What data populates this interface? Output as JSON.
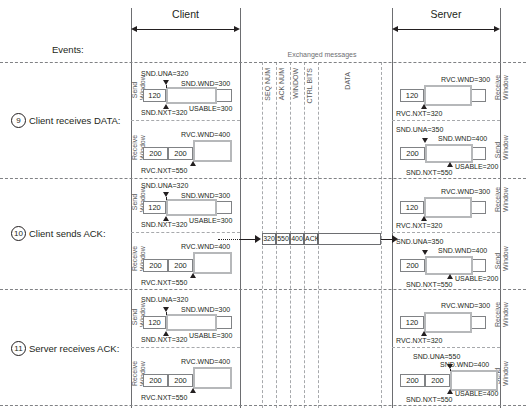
{
  "headers": {
    "client": "Client",
    "server": "Server",
    "events": "Events:",
    "exchanged": "Exchanged messages"
  },
  "message_fields": [
    "SEQ NUM",
    "ACK NUM",
    "WINDOW",
    "CTRL BITS",
    "DATA"
  ],
  "side_labels": {
    "send": "Send\nWindow",
    "receive": "Receive\nWindow"
  },
  "side_label_send_l1": "Send",
  "side_label_send_l2": "Window",
  "side_label_recv_l1": "Receive",
  "side_label_recv_l2": "Window",
  "rows": [
    {
      "num": "9",
      "event": "Client receives DATA:",
      "client": {
        "send": {
          "left_seg": "120",
          "una": "SND.UNA=320",
          "wnd": "SND.WND=300",
          "usable": "USABLE=300",
          "nxt": "SND.NXT=320"
        },
        "receive": {
          "seg1": "200",
          "seg2": "200",
          "wnd": "RVC.WND=400",
          "nxt": "RVC.NXT=550"
        }
      },
      "server": {
        "receive": {
          "left_seg": "120",
          "wnd": "RVC.WND=300",
          "nxt": "RVC.NXT=320"
        },
        "send": {
          "seg1": "200",
          "seg2": "200",
          "una": "SND.UNA=350",
          "wnd": "SND.WND=400",
          "usable": "USABLE=200",
          "nxt": "SND.NXT=550"
        }
      },
      "message": null
    },
    {
      "num": "10",
      "event": "Client sends ACK:",
      "client": {
        "send": {
          "left_seg": "120",
          "una": "SND.UNA=320",
          "wnd": "SND.WND=300",
          "usable": "USABLE=300",
          "nxt": "SND.NXT=320"
        },
        "receive": {
          "seg1": "200",
          "seg2": "200",
          "wnd": "RVC.WND=400",
          "nxt": "RVC.NXT=550"
        }
      },
      "server": {
        "receive": {
          "left_seg": "120",
          "wnd": "RVC.WND=300",
          "nxt": "RVC.NXT=320"
        },
        "send": {
          "seg1": "200",
          "seg2": "200",
          "una": "SND.UNA=350",
          "wnd": "SND.WND=400",
          "usable": "USABLE=200",
          "nxt": "SND.NXT=550"
        }
      },
      "message": {
        "seq_num": "320",
        "ack_num": "550",
        "window": "400",
        "ctrl_bits": "ACK",
        "data": "",
        "direction": "client-to-server"
      }
    },
    {
      "num": "11",
      "event": "Server receives ACK:",
      "client": {
        "send": {
          "left_seg": "120",
          "una": "SND.UNA=320",
          "wnd": "SND.WND=300",
          "usable": "USABLE=300",
          "nxt": "SND.NXT=320"
        },
        "receive": {
          "seg1": "200",
          "seg2": "200",
          "wnd": "RVC.WND=400",
          "nxt": "RVC.NXT=550"
        }
      },
      "server": {
        "receive": {
          "left_seg": "120",
          "wnd": "RVC.WND=300",
          "nxt": "RVC.NXT=320"
        },
        "send": {
          "seg1": "200",
          "seg2": "200",
          "una": "SND.UNA=550",
          "wnd": "SND.WND=400",
          "usable": "USABLE=400",
          "nxt": "SND.NXT=550"
        }
      },
      "message": null
    }
  ],
  "colors": {
    "window_border": "#b6b8ba",
    "seg_border": "#808285",
    "text": "#231f20",
    "muted": "#58595b",
    "dash": "#a7a9ac"
  }
}
